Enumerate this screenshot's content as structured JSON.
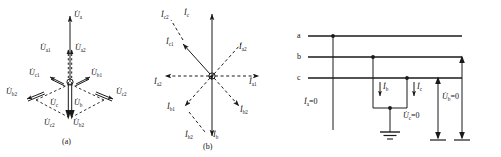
{
  "figure": {
    "caption_a": "(a)",
    "caption_b": "(b)"
  },
  "diagram_a": {
    "title": "voltage-phasor-diagram",
    "captions": {
      "label": "(a)"
    },
    "labels": {
      "ua": {
        "sym": "U",
        "sub": "a"
      },
      "ua1": {
        "sym": "U",
        "sub": "a1"
      },
      "ua2": {
        "sym": "U",
        "sub": "a2"
      },
      "uc1": {
        "sym": "U",
        "sub": "c1"
      },
      "ub1": {
        "sym": "U",
        "sub": "b1"
      },
      "ub2_left": {
        "sym": "U",
        "sub": "b2"
      },
      "uc2_right": {
        "sym": "U",
        "sub": "c2"
      },
      "uc": {
        "sym": "U",
        "sub": "c"
      },
      "ub": {
        "sym": "U",
        "sub": "b"
      },
      "uc2_bottom": {
        "sym": "U",
        "sub": "c2"
      },
      "ub2_bottom": {
        "sym": "U",
        "sub": "b2"
      }
    }
  },
  "diagram_b": {
    "title": "current-phasor-diagram",
    "captions": {
      "label": "(b)"
    },
    "labels": {
      "ic2_top": {
        "sym": "I",
        "sub": "c2"
      },
      "ic_top": {
        "sym": "I",
        "sub": "c"
      },
      "ic1": {
        "sym": "I",
        "sub": "c1"
      },
      "ia2_upper_right": {
        "sym": "I",
        "sub": "a2"
      },
      "ia2_left": {
        "sym": "I",
        "sub": "a2"
      },
      "ia1_right": {
        "sym": "I",
        "sub": "a1"
      },
      "ib1": {
        "sym": "I",
        "sub": "b1"
      },
      "ib2": {
        "sym": "I",
        "sub": "b2"
      },
      "ib2_bottom": {
        "sym": "I",
        "sub": "b2"
      },
      "ib_bottom": {
        "sym": "I",
        "sub": "b"
      }
    }
  },
  "diagram_c": {
    "title": "three-phase-fault-circuit",
    "phase_labels": {
      "a": "a",
      "b": "b",
      "c": "c"
    },
    "annotations": {
      "ia_zero": {
        "sym": "I",
        "sub": "a",
        "eq": "=0"
      },
      "ib": {
        "sym": "I",
        "sub": "b"
      },
      "ic": {
        "sym": "I",
        "sub": "c"
      },
      "ub_zero": {
        "sym": "U",
        "sub": "b",
        "eq": "=0"
      },
      "uc_zero": {
        "sym": "U",
        "sub": "c",
        "eq": "=0"
      }
    }
  },
  "colors": {
    "line": "#1a1a1a",
    "dash": "#1a1a1a",
    "background": "#ffffff",
    "text": "#111111"
  }
}
